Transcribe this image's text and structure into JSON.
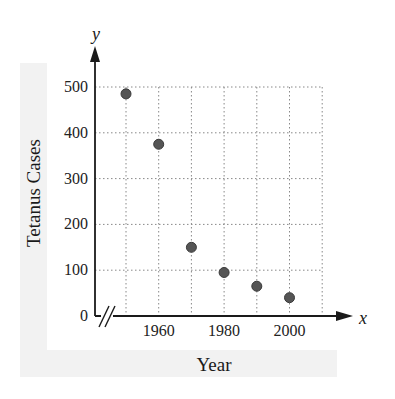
{
  "chart_data": {
    "type": "scatter",
    "title": "",
    "xlabel": "Year",
    "ylabel": "Tetanus Cases",
    "x_axis_variable": "x",
    "y_axis_variable": "y",
    "x": [
      1950,
      1960,
      1970,
      1980,
      1990,
      2000
    ],
    "y": [
      485,
      375,
      150,
      95,
      65,
      40
    ],
    "xlim": [
      1940,
      2010
    ],
    "ylim": [
      0,
      500
    ],
    "x_ticks": [
      1960,
      1980,
      2000
    ],
    "x_tick_labels": [
      "1960",
      "1980",
      "2000"
    ],
    "y_ticks": [
      0,
      100,
      200,
      300,
      400,
      500
    ],
    "y_tick_labels": [
      "0",
      "100",
      "200",
      "300",
      "400",
      "500"
    ],
    "grid": true,
    "grid_style": "dotted",
    "x_axis_break": true,
    "legend": null,
    "point_color": "#555555"
  }
}
